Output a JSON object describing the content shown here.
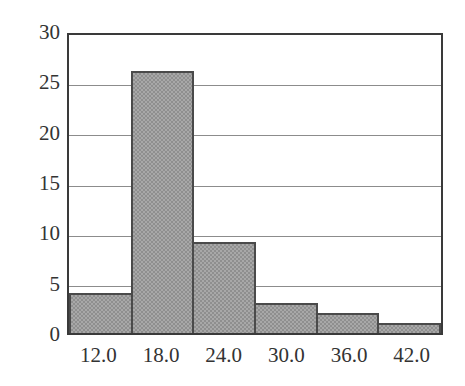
{
  "chart_data": {
    "type": "bar",
    "title": "",
    "subtitle": "",
    "xlabel": "",
    "ylabel": "",
    "categories": [
      "12.0",
      "18.0",
      "24.0",
      "30.0",
      "36.0",
      "42.0"
    ],
    "values": [
      4,
      26,
      9,
      3,
      2,
      1
    ],
    "ylim": [
      0,
      30
    ],
    "yticks": [
      0,
      5,
      10,
      15,
      20,
      25,
      30
    ],
    "ytick_labels": [
      "0",
      "5",
      "10",
      "15",
      "20",
      "25",
      "30"
    ],
    "xtick_labels": [
      "12.0",
      "18.0",
      "24.0",
      "30.0",
      "36.0",
      "42.0"
    ],
    "grid": true,
    "grid_axis": "y",
    "legend": false,
    "legend_position": "none",
    "bar_fill_color": "#a8a8a8",
    "bar_edge_color": "#4a4a4a",
    "axis_color": "#3a3a3a",
    "gridline_color": "#8c8c8c",
    "background_color": "#ffffff",
    "text_color": "#333333",
    "bars_contiguous": true,
    "annotations": []
  }
}
